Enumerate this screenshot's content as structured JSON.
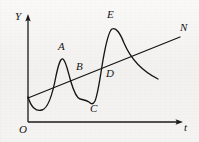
{
  "figure": {
    "type": "math-graph-figure",
    "background_color": "#f3f2f0",
    "ink_color": "#141414"
  },
  "axes": {
    "y_axis": {
      "label": "Y",
      "name": "vertical-axis",
      "from": [
        28,
        122
      ],
      "to": [
        28,
        16
      ],
      "arrow": "up"
    },
    "x_axis": {
      "label": "t",
      "name": "horizontal-axis",
      "from": [
        28,
        122
      ],
      "to": [
        183,
        122
      ],
      "arrow": "right"
    },
    "origin": {
      "label": "O",
      "x": 21,
      "y": 130
    }
  },
  "labels": [
    {
      "id": "A",
      "text": "A",
      "x": 58,
      "y": 46,
      "point": [
        62,
        59
      ]
    },
    {
      "id": "B",
      "text": "B",
      "x": 77,
      "y": 65,
      "point": [
        81,
        83
      ]
    },
    {
      "id": "C",
      "text": "C",
      "x": 90,
      "y": 105,
      "point": [
        93,
        104
      ]
    },
    {
      "id": "D",
      "text": "D",
      "x": 107,
      "y": 72,
      "point": [
        107,
        83
      ]
    },
    {
      "id": "E",
      "text": "E",
      "x": 108,
      "y": 13,
      "point": [
        113,
        29
      ]
    },
    {
      "id": "N",
      "text": "N",
      "x": 181,
      "y": 26,
      "point": [
        180,
        37
      ]
    }
  ],
  "chart_data": {
    "type": "line",
    "title": "",
    "xlabel": "t",
    "ylabel": "Y",
    "grid": false,
    "legend": null,
    "series": [
      {
        "name": "oscillating-curve",
        "type": "curve",
        "path": "M 28 97 C 31 107, 36 112, 42 110 C 49 108, 53 92, 56 76 C 59 62, 61 58, 63 59 C 66 61, 68 72, 71 82 C 74 92, 77 98, 80 99 C 83 100, 86 100, 89 102 C 91 104, 93 105, 95 101 C 98 94, 100 78, 103 60 C 106 43, 109 31, 112 29 C 116 27, 120 33, 124 43 C 130 57, 140 70, 158 79"
      },
      {
        "name": "straight-trend-line",
        "type": "line",
        "path": "M 28 98 L 180 37",
        "from": [
          28,
          98
        ],
        "to": [
          180,
          37
        ]
      }
    ],
    "annotations": [
      {
        "label": "A",
        "desc": "first local maximum of the curve"
      },
      {
        "label": "B",
        "desc": "intersection of curve and line on the descending branch after A"
      },
      {
        "label": "C",
        "desc": "local minimum of the curve"
      },
      {
        "label": "D",
        "desc": "intersection of curve and line on the ascending branch toward E"
      },
      {
        "label": "E",
        "desc": "second, higher local maximum of the curve"
      },
      {
        "label": "N",
        "desc": "upper-right end of the straight line"
      }
    ]
  }
}
